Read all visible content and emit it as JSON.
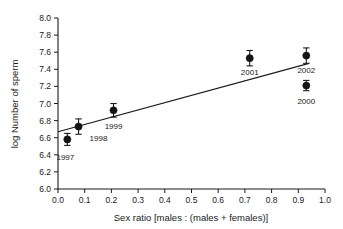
{
  "chart_data": {
    "type": "scatter",
    "title": "",
    "xlabel": "Sex ratio [males : (males + females)]",
    "ylabel": "log Number of sperm",
    "xlim": [
      0.0,
      1.0
    ],
    "ylim": [
      6.0,
      8.0
    ],
    "grid": false,
    "legend": "none",
    "xticks": [
      "0.0",
      "0.1",
      "0.2",
      "0.3",
      "0.4",
      "0.5",
      "0.6",
      "0.7",
      "0.8",
      "0.9",
      "1.0"
    ],
    "xtick_values": [
      0.0,
      0.1,
      0.2,
      0.3,
      0.4,
      0.5,
      0.6,
      0.7,
      0.8,
      0.9,
      1.0
    ],
    "yticks": [
      "6.0",
      "6.2",
      "6.4",
      "6.6",
      "6.8",
      "7.0",
      "7.2",
      "7.4",
      "7.6",
      "7.8",
      "8.0"
    ],
    "ytick_values": [
      6.0,
      6.2,
      6.4,
      6.6,
      6.8,
      7.0,
      7.2,
      7.4,
      7.6,
      7.8,
      8.0
    ],
    "points": [
      {
        "label": "1997",
        "x": 0.035,
        "y": 6.58,
        "yerr": 0.07,
        "label_dx": -2,
        "label_dy": 21,
        "label_anchor": "middle"
      },
      {
        "label": "1998",
        "x": 0.077,
        "y": 6.73,
        "yerr": 0.09,
        "label_dx": 11,
        "label_dy": 14,
        "label_anchor": "start"
      },
      {
        "label": "1999",
        "x": 0.208,
        "y": 6.92,
        "yerr": 0.08,
        "label_dx": 0,
        "label_dy": 19,
        "label_anchor": "middle"
      },
      {
        "label": "2001",
        "x": 0.718,
        "y": 7.53,
        "yerr": 0.09,
        "label_dx": 0,
        "label_dy": 17,
        "label_anchor": "middle"
      },
      {
        "label": "2002",
        "x": 0.93,
        "y": 7.56,
        "yerr": 0.09,
        "label_dx": 0,
        "label_dy": 17,
        "label_anchor": "middle"
      },
      {
        "label": "2000",
        "x": 0.93,
        "y": 7.21,
        "yerr": 0.06,
        "label_dx": 0,
        "label_dy": 18,
        "label_anchor": "middle"
      }
    ],
    "fit_line": {
      "x0": 0.0,
      "y0": 6.67,
      "x1": 0.94,
      "y1": 7.47
    }
  },
  "colors": {
    "marker": "#141414",
    "axis": "#1a1a1a",
    "background": "#ffffff"
  }
}
